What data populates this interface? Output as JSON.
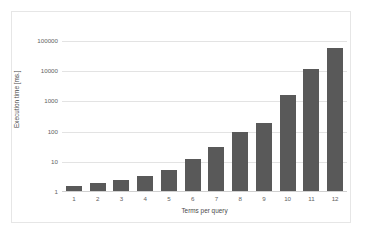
{
  "chart_data": {
    "type": "bar",
    "title": "",
    "subtitle": "",
    "xlabel": "Terms per query",
    "ylabel": "Execution time [ms.]",
    "categories": [
      "1",
      "2",
      "3",
      "4",
      "5",
      "6",
      "7",
      "8",
      "9",
      "10",
      "11",
      "12"
    ],
    "values": [
      1.6,
      2.0,
      2.5,
      3.5,
      5.5,
      12,
      30,
      100,
      200,
      1600,
      11500,
      57000
    ],
    "series": [
      {
        "name": "Execution time",
        "values": [
          1.6,
          2.0,
          2.5,
          3.5,
          5.5,
          12,
          30,
          100,
          200,
          1600,
          11500,
          57000
        ]
      }
    ],
    "yscale": "log",
    "ylim": [
      1,
      100000
    ],
    "y_tick_labels": [
      "1",
      "10",
      "100",
      "1000",
      "10000",
      "100000"
    ],
    "y_tick_values": [
      1,
      10,
      100,
      1000,
      10000,
      100000
    ],
    "x_tick_labels": [
      "1",
      "2",
      "3",
      "4",
      "5",
      "6",
      "7",
      "8",
      "9",
      "10",
      "11",
      "12"
    ],
    "grid": true,
    "grid_axis": "y",
    "legend": false,
    "legend_position": "none",
    "bar_color": "#595959",
    "gridline_color": "#e3e3e3",
    "plot_background": "#ffffff",
    "frame_color": "#e6e6e6",
    "tick_label_color": "#636363",
    "axis_title_color": "#4a4a4a"
  }
}
